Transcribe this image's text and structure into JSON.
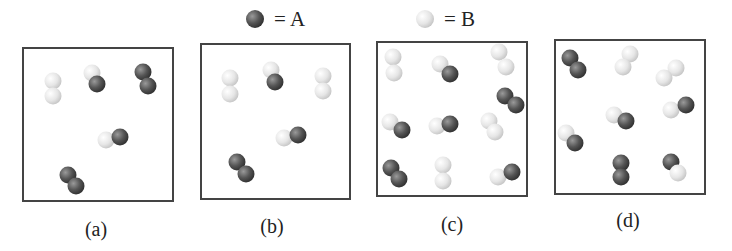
{
  "legend": {
    "a": {
      "symbol": "dark-sphere",
      "text": "= A",
      "color": "#555555"
    },
    "b": {
      "symbol": "light-sphere",
      "text": "= B",
      "color": "#e6e6e6"
    }
  },
  "colors": {
    "atom_a": "#5a5a5a",
    "atom_b": "#e8e8e8",
    "border": "#444444"
  },
  "panels": [
    {
      "label": "(a)",
      "box": [
        22,
        47,
        152,
        155
      ],
      "label_pos": [
        96,
        218
      ],
      "molecules": [
        {
          "type": "B2",
          "atoms": [
            [
              "B",
              53,
              81
            ],
            [
              "B",
              53,
              96
            ]
          ]
        },
        {
          "type": "AB",
          "atoms": [
            [
              "B",
              92,
              73
            ],
            [
              "A",
              97,
              84
            ]
          ]
        },
        {
          "type": "A2",
          "atoms": [
            [
              "A",
              143,
              72
            ],
            [
              "A",
              148,
              86
            ]
          ]
        },
        {
          "type": "AB",
          "atoms": [
            [
              "B",
              106,
              140
            ],
            [
              "A",
              120,
              137
            ]
          ]
        },
        {
          "type": "A2",
          "atoms": [
            [
              "A",
              68,
              175
            ],
            [
              "A",
              76,
              186
            ]
          ]
        }
      ]
    },
    {
      "label": "(b)",
      "box": [
        200,
        43,
        151,
        157
      ],
      "label_pos": [
        272,
        215
      ],
      "molecules": [
        {
          "type": "B2",
          "atoms": [
            [
              "B",
              230,
              78
            ],
            [
              "B",
              230,
              94
            ]
          ]
        },
        {
          "type": "AB",
          "atoms": [
            [
              "B",
              271,
              70
            ],
            [
              "A",
              275,
              82
            ]
          ]
        },
        {
          "type": "B2",
          "atoms": [
            [
              "B",
              323,
              76
            ],
            [
              "B",
              323,
              91
            ]
          ]
        },
        {
          "type": "AB",
          "atoms": [
            [
              "B",
              284,
              138
            ],
            [
              "A",
              298,
              135
            ]
          ]
        },
        {
          "type": "A2",
          "atoms": [
            [
              "A",
              237,
              162
            ],
            [
              "A",
              246,
              174
            ]
          ]
        }
      ]
    },
    {
      "label": "(c)",
      "box": [
        376,
        41,
        152,
        156
      ],
      "label_pos": [
        452,
        213
      ],
      "molecules": [
        {
          "type": "B2",
          "atoms": [
            [
              "B",
              393,
              57
            ],
            [
              "B",
              394,
              73
            ]
          ]
        },
        {
          "type": "AB",
          "atoms": [
            [
              "B",
              440,
              64
            ],
            [
              "A",
              450,
              74
            ]
          ]
        },
        {
          "type": "B2",
          "atoms": [
            [
              "B",
              499,
              52
            ],
            [
              "B",
              506,
              67
            ]
          ]
        },
        {
          "type": "A2",
          "atoms": [
            [
              "A",
              505,
              96
            ],
            [
              "A",
              516,
              105
            ]
          ]
        },
        {
          "type": "AB",
          "atoms": [
            [
              "B",
              390,
              122
            ],
            [
              "A",
              402,
              130
            ]
          ]
        },
        {
          "type": "AB",
          "atoms": [
            [
              "B",
              437,
              126
            ],
            [
              "A",
              450,
              124
            ]
          ]
        },
        {
          "type": "B2",
          "atoms": [
            [
              "B",
              489,
              121
            ],
            [
              "B",
              495,
              132
            ]
          ]
        },
        {
          "type": "A2",
          "atoms": [
            [
              "A",
              391,
              168
            ],
            [
              "A",
              399,
              179
            ]
          ]
        },
        {
          "type": "B2",
          "atoms": [
            [
              "B",
              443,
              165
            ],
            [
              "B",
              443,
              181
            ]
          ]
        },
        {
          "type": "AB",
          "atoms": [
            [
              "B",
              498,
              177
            ],
            [
              "A",
              512,
              172
            ]
          ]
        }
      ]
    },
    {
      "label": "(d)",
      "box": [
        554,
        39,
        152,
        156
      ],
      "label_pos": [
        628,
        209
      ],
      "molecules": [
        {
          "type": "A2",
          "atoms": [
            [
              "A",
              570,
              58
            ],
            [
              "A",
              578,
              70
            ]
          ]
        },
        {
          "type": "B2",
          "atoms": [
            [
              "B",
              630,
              54
            ],
            [
              "B",
              623,
              67
            ]
          ]
        },
        {
          "type": "B2",
          "atoms": [
            [
              "B",
              676,
              68
            ],
            [
              "B",
              664,
              78
            ]
          ]
        },
        {
          "type": "AB",
          "atoms": [
            [
              "B",
              614,
              115
            ],
            [
              "A",
              626,
              121
            ]
          ]
        },
        {
          "type": "AB",
          "atoms": [
            [
              "B",
              671,
              110
            ],
            [
              "A",
              686,
              105
            ]
          ]
        },
        {
          "type": "AB",
          "atoms": [
            [
              "B",
              566,
              133
            ],
            [
              "A",
              575,
              143
            ]
          ]
        },
        {
          "type": "A2",
          "atoms": [
            [
              "A",
              621,
              163
            ],
            [
              "A",
              621,
              177
            ]
          ]
        },
        {
          "type": "AB",
          "atoms": [
            [
              "A",
              671,
              162
            ],
            [
              "B",
              678,
              173
            ]
          ]
        }
      ]
    }
  ]
}
